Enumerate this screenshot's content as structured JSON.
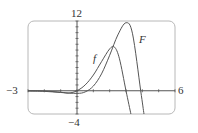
{
  "chart_data": {
    "type": "line",
    "title": "",
    "xlabel": "",
    "ylabel": "",
    "xlim": [
      -3,
      6
    ],
    "ylim": [
      -4,
      12
    ],
    "tick_labels": {
      "x_min": "−3",
      "x_max": "6",
      "y_max": "12",
      "y_min": "−4"
    },
    "x_ticks": [
      -3,
      -2,
      -1,
      0,
      1,
      2,
      3,
      4,
      5,
      6
    ],
    "y_ticks": [
      -4,
      -3,
      -2,
      -1,
      0,
      1,
      2,
      3,
      4,
      5,
      6,
      7,
      8,
      9,
      10,
      11,
      12
    ],
    "grid": false,
    "series": [
      {
        "name": "f",
        "label": "f",
        "x": [
          -3,
          -2,
          -1,
          -0.5,
          0,
          0.5,
          1,
          1.5,
          2,
          2.3,
          2.6,
          3.0,
          3.3
        ],
        "y": [
          0,
          -0.05,
          -0.25,
          -0.4,
          0,
          1.0,
          2.7,
          5.0,
          7.2,
          7.5,
          5.5,
          0,
          -4
        ]
      },
      {
        "name": "F",
        "label": "F",
        "x": [
          -3,
          -2,
          -1,
          0,
          0.5,
          1,
          1.5,
          2,
          2.5,
          3.0,
          3.4,
          3.9,
          4.1
        ],
        "y": [
          -0.05,
          -0.1,
          -0.3,
          -0.45,
          -0.2,
          0.8,
          2.9,
          6.1,
          9.6,
          11.7,
          9.8,
          0,
          -4
        ]
      }
    ],
    "annotations": [
      {
        "text": "f",
        "x": 1.1,
        "y": 5.3
      },
      {
        "text": "F",
        "x": 3.8,
        "y": 9.6
      }
    ],
    "legend": "inline labels"
  }
}
